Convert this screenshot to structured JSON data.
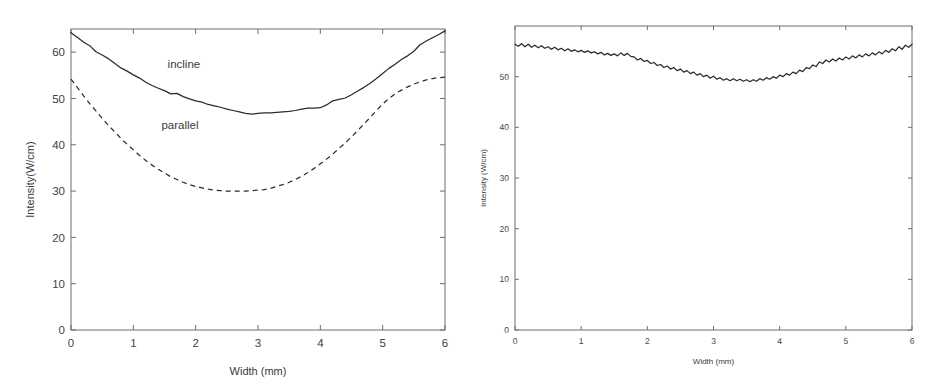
{
  "figure": {
    "background": "#ffffff",
    "ink_color": "#2b2b2b",
    "axis_color": "#6e6e6e"
  },
  "chart_data": [
    {
      "id": "left",
      "type": "line",
      "title": "",
      "xlabel": "Width (mm)",
      "ylabel": "Intensity(W/cm)",
      "xlim": [
        0,
        6
      ],
      "ylim": [
        0,
        65
      ],
      "xticks": [
        0,
        1,
        2,
        3,
        4,
        5,
        6
      ],
      "xticklabels": [
        "0",
        "1",
        "2",
        "3",
        "4",
        "5",
        "6"
      ],
      "yticks": [
        0,
        10,
        20,
        30,
        40,
        50,
        60
      ],
      "yticklabels": [
        "0",
        "10",
        "20",
        "30",
        "40",
        "50",
        "60"
      ],
      "grid": false,
      "legend_position": "inline-annotations",
      "annotations": [
        {
          "text": "incline",
          "x": 1.55,
          "y": 56.5
        },
        {
          "text": "parallel",
          "x": 1.45,
          "y": 43.5
        }
      ],
      "series": [
        {
          "name": "incline",
          "style": "solid",
          "x": [
            0.0,
            0.1,
            0.2,
            0.3,
            0.4,
            0.5,
            0.6,
            0.7,
            0.8,
            0.9,
            1.0,
            1.1,
            1.2,
            1.3,
            1.4,
            1.5,
            1.6,
            1.7,
            1.8,
            1.9,
            2.0,
            2.1,
            2.2,
            2.3,
            2.4,
            2.5,
            2.6,
            2.7,
            2.8,
            2.9,
            3.0,
            3.1,
            3.2,
            3.3,
            3.4,
            3.5,
            3.6,
            3.7,
            3.8,
            3.9,
            4.0,
            4.1,
            4.2,
            4.3,
            4.4,
            4.5,
            4.6,
            4.7,
            4.8,
            4.9,
            5.0,
            5.1,
            5.2,
            5.3,
            5.4,
            5.5,
            5.6,
            5.7,
            5.8,
            5.9,
            6.0
          ],
          "y": [
            64.2,
            63.2,
            62.2,
            61.4,
            60.1,
            59.4,
            58.6,
            57.6,
            56.6,
            55.9,
            55.1,
            54.4,
            53.5,
            52.8,
            52.2,
            51.7,
            51.0,
            51.1,
            50.4,
            49.9,
            49.5,
            49.2,
            48.7,
            48.4,
            48.1,
            47.7,
            47.4,
            47.1,
            46.8,
            46.6,
            46.8,
            46.9,
            46.9,
            47.0,
            47.1,
            47.2,
            47.4,
            47.7,
            47.9,
            47.9,
            48.0,
            48.6,
            49.5,
            49.8,
            50.1,
            50.8,
            51.6,
            52.4,
            53.3,
            54.3,
            55.4,
            56.5,
            57.4,
            58.4,
            59.2,
            60.2,
            61.6,
            62.4,
            63.1,
            63.8,
            64.6
          ]
        },
        {
          "name": "parallel",
          "style": "dashed",
          "x": [
            0.0,
            0.1,
            0.2,
            0.3,
            0.4,
            0.5,
            0.6,
            0.7,
            0.8,
            0.9,
            1.0,
            1.1,
            1.2,
            1.3,
            1.4,
            1.5,
            1.6,
            1.7,
            1.8,
            1.9,
            2.0,
            2.1,
            2.2,
            2.3,
            2.4,
            2.5,
            2.6,
            2.7,
            2.8,
            2.9,
            3.0,
            3.1,
            3.2,
            3.3,
            3.4,
            3.5,
            3.6,
            3.7,
            3.8,
            3.9,
            4.0,
            4.1,
            4.2,
            4.3,
            4.4,
            4.5,
            4.6,
            4.7,
            4.8,
            4.9,
            5.0,
            5.1,
            5.2,
            5.3,
            5.4,
            5.5,
            5.6,
            5.7,
            5.8,
            5.9,
            6.0
          ],
          "y": [
            54.2,
            52.4,
            50.6,
            48.9,
            47.3,
            45.7,
            44.2,
            42.8,
            41.4,
            40.1,
            38.9,
            37.7,
            36.6,
            35.6,
            34.7,
            33.9,
            33.1,
            32.5,
            31.9,
            31.4,
            31.0,
            30.7,
            30.4,
            30.2,
            30.1,
            30.0,
            30.0,
            30.0,
            30.0,
            30.1,
            30.2,
            30.3,
            30.6,
            31.0,
            31.4,
            31.9,
            32.5,
            33.2,
            34.0,
            34.9,
            35.9,
            36.9,
            38.0,
            39.2,
            40.4,
            41.7,
            43.1,
            44.5,
            45.9,
            47.4,
            48.8,
            50.0,
            51.0,
            51.8,
            52.5,
            53.1,
            53.6,
            54.0,
            54.3,
            54.5,
            54.6
          ]
        }
      ]
    },
    {
      "id": "right",
      "type": "line",
      "title": "",
      "xlabel": "Width (mm)",
      "ylabel": "Intensity (W/cm)",
      "xlim": [
        0,
        6
      ],
      "ylim": [
        0,
        60
      ],
      "xticks": [
        0,
        1,
        2,
        3,
        4,
        5,
        6
      ],
      "xticklabels": [
        "0",
        "1",
        "2",
        "3",
        "4",
        "5",
        "6"
      ],
      "yticks": [
        0,
        10,
        20,
        30,
        40,
        50
      ],
      "yticklabels": [
        "0",
        "10",
        "20",
        "30",
        "40",
        "50"
      ],
      "grid": false,
      "legend_position": "none",
      "annotations": [],
      "series": [
        {
          "name": "flattened",
          "style": "solid",
          "x": [
            0.0,
            0.05,
            0.1,
            0.15,
            0.2,
            0.25,
            0.3,
            0.35,
            0.4,
            0.45,
            0.5,
            0.55,
            0.6,
            0.65,
            0.7,
            0.75,
            0.8,
            0.85,
            0.9,
            0.95,
            1.0,
            1.05,
            1.1,
            1.15,
            1.2,
            1.25,
            1.3,
            1.35,
            1.4,
            1.45,
            1.5,
            1.55,
            1.6,
            1.65,
            1.7,
            1.75,
            1.8,
            1.85,
            1.9,
            1.95,
            2.0,
            2.05,
            2.1,
            2.15,
            2.2,
            2.25,
            2.3,
            2.35,
            2.4,
            2.45,
            2.5,
            2.55,
            2.6,
            2.65,
            2.7,
            2.75,
            2.8,
            2.85,
            2.9,
            2.95,
            3.0,
            3.05,
            3.1,
            3.15,
            3.2,
            3.25,
            3.3,
            3.35,
            3.4,
            3.45,
            3.5,
            3.55,
            3.6,
            3.65,
            3.7,
            3.75,
            3.8,
            3.85,
            3.9,
            3.95,
            4.0,
            4.05,
            4.1,
            4.15,
            4.2,
            4.25,
            4.3,
            4.35,
            4.4,
            4.45,
            4.5,
            4.55,
            4.6,
            4.65,
            4.7,
            4.75,
            4.8,
            4.85,
            4.9,
            4.95,
            5.0,
            5.05,
            5.1,
            5.15,
            5.2,
            5.25,
            5.3,
            5.35,
            5.4,
            5.45,
            5.5,
            5.55,
            5.6,
            5.65,
            5.7,
            5.75,
            5.8,
            5.85,
            5.9,
            5.95,
            6.0
          ],
          "y": [
            56.4,
            56.0,
            56.5,
            55.9,
            56.4,
            55.8,
            56.2,
            55.7,
            56.1,
            55.6,
            55.9,
            55.4,
            55.8,
            55.3,
            55.6,
            55.1,
            55.5,
            55.0,
            55.3,
            54.9,
            55.2,
            54.8,
            55.1,
            54.7,
            54.9,
            54.5,
            54.8,
            54.3,
            54.6,
            54.2,
            54.5,
            54.1,
            54.7,
            54.2,
            54.6,
            54.0,
            53.9,
            53.3,
            53.6,
            53.0,
            53.2,
            52.6,
            52.8,
            52.2,
            52.4,
            51.8,
            52.1,
            51.5,
            51.8,
            51.2,
            51.5,
            50.9,
            51.2,
            50.6,
            50.9,
            50.3,
            50.6,
            50.0,
            50.3,
            49.7,
            50.1,
            49.5,
            49.8,
            49.3,
            49.6,
            49.2,
            49.6,
            49.2,
            49.5,
            49.1,
            49.4,
            49.0,
            49.4,
            49.1,
            49.6,
            49.3,
            49.8,
            49.5,
            50.0,
            49.7,
            50.3,
            50.0,
            50.6,
            50.3,
            50.9,
            50.6,
            51.3,
            51.0,
            51.8,
            51.6,
            52.3,
            52.0,
            52.9,
            52.6,
            53.3,
            52.9,
            53.5,
            53.1,
            53.7,
            53.3,
            53.9,
            53.5,
            54.1,
            53.7,
            54.3,
            53.9,
            54.5,
            54.1,
            54.7,
            54.3,
            54.9,
            54.5,
            55.2,
            54.8,
            55.5,
            55.1,
            55.9,
            55.4,
            56.2,
            55.8,
            56.4
          ]
        }
      ]
    }
  ]
}
